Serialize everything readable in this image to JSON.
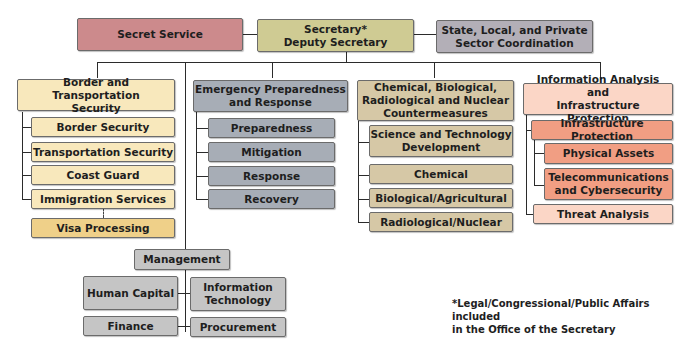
{
  "top_row": {
    "secret_service": "Secret Service",
    "secretary": "Secretary*\nDeputy Secretary",
    "state_local": "State, Local, and Private\nSector Coordination"
  },
  "divisions": [
    {
      "title": "Border and Transportation\nSecurity",
      "color": "#f8e8bc",
      "units": [
        "Border Security",
        "Transportation Security",
        "Coast Guard",
        "Immigration Services"
      ],
      "sub_unit": "Visa Processing"
    },
    {
      "title": "Emergency Preparedness\nand Response",
      "color": "#a7adb6",
      "units": [
        "Preparedness",
        "Mitigation",
        "Response",
        "Recovery"
      ]
    },
    {
      "title": "Chemical, Biological,\nRadiological and Nuclear\nCountermeasures",
      "color": "#d6c8a6",
      "units": [
        "Science and Technology\nDevelopment",
        "Chemical",
        "Biological/Agricultural",
        "Radiological/Nuclear"
      ]
    },
    {
      "title": "Information Analysis and\nInfrastructure Protection",
      "color": "#fbd6c6",
      "units": [
        "Infrastructure Protection",
        "Threat Analysis"
      ],
      "infrastructure_subunits": [
        "Physical Assets",
        "Telecommunications\nand Cybersecurity"
      ]
    }
  ],
  "management": {
    "title": "Management",
    "units": [
      "Human Capital",
      "Information\nTechnology",
      "Finance",
      "Procurement"
    ]
  },
  "footnote": "*Legal/Congressional/Public Affairs included\nin the Office of the Secretary"
}
